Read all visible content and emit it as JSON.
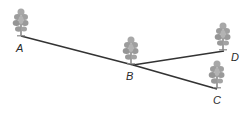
{
  "diagram": {
    "background": "#ffffff",
    "line_color": "#333333",
    "tree_color": "#9a9a9a",
    "nodes": [
      {
        "id": "A",
        "label": "A",
        "x": 21,
        "y": 36,
        "tree_top": 8,
        "label_x": 16,
        "label_y": 52
      },
      {
        "id": "B",
        "label": "B",
        "x": 133,
        "y": 65,
        "tree_top": 37,
        "label_x": 126,
        "label_y": 80
      },
      {
        "id": "C",
        "label": "C",
        "x": 217,
        "y": 89,
        "tree_top": 61,
        "label_x": 213,
        "label_y": 103
      },
      {
        "id": "D",
        "label": "D",
        "x": 224,
        "y": 51,
        "tree_top": 23,
        "label_x": 231,
        "label_y": 60
      }
    ],
    "edges": [
      {
        "from": "A",
        "to": "B"
      },
      {
        "from": "B",
        "to": "D"
      },
      {
        "from": "B",
        "to": "C"
      }
    ]
  }
}
